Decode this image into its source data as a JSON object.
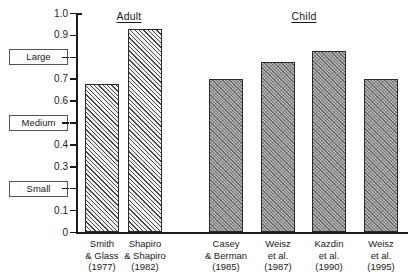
{
  "chart_data": {
    "type": "bar",
    "title": "",
    "subtitle": "",
    "xlabel": "",
    "ylabel": "",
    "ylim": [
      0,
      1.0
    ],
    "grid": false,
    "legend_position": "none",
    "group_labels": [
      "Adult",
      "Child"
    ],
    "y_ticks": [
      "1.0",
      "0.9",
      "0.8",
      "0.7",
      "0.6",
      "0.5",
      "0.4",
      "0.3",
      "0.2",
      "0.1",
      "0"
    ],
    "y_tick_values": [
      1.0,
      0.9,
      0.8,
      0.7,
      0.6,
      0.5,
      0.4,
      0.3,
      0.2,
      0.1,
      0
    ],
    "magnitude_labels": [
      {
        "label": "Large",
        "value": 0.8
      },
      {
        "label": "Medium",
        "value": 0.5
      },
      {
        "label": "Small",
        "value": 0.2
      }
    ],
    "categories": [
      "Smith & Glass (1977)",
      "Shapiro & Shapiro (1982)",
      "Casey & Berman (1985)",
      "Weisz et al. (1987)",
      "Kazdin et al. (1990)",
      "Weisz et al. (1995)"
    ],
    "values": [
      0.68,
      0.93,
      0.7,
      0.78,
      0.83,
      0.7
    ],
    "bars": [
      {
        "group": "Adult",
        "line1": "Smith",
        "line2": "& Glass",
        "year": "(1977)",
        "value": 0.68
      },
      {
        "group": "Adult",
        "line1": "Shapiro",
        "line2": "& Shapiro",
        "year": "(1982)",
        "value": 0.93
      },
      {
        "group": "Child",
        "line1": "Casey",
        "line2": "& Berman",
        "year": "(1985)",
        "value": 0.7
      },
      {
        "group": "Child",
        "line1": "Weisz",
        "line2": "et al.",
        "year": "(1987)",
        "value": 0.78
      },
      {
        "group": "Child",
        "line1": "Kazdin",
        "line2": "et al.",
        "year": "(1990)",
        "value": 0.83
      },
      {
        "group": "Child",
        "line1": "Weisz",
        "line2": "et al.",
        "year": "(1995)",
        "value": 0.7
      }
    ],
    "colors": {
      "adult_fill": "#f2f2f2",
      "child_fill": "#b9b9b9",
      "bar_outline": "#2a2a2a",
      "axis": "#1a1a1a",
      "text": "#1a1a1a"
    }
  }
}
